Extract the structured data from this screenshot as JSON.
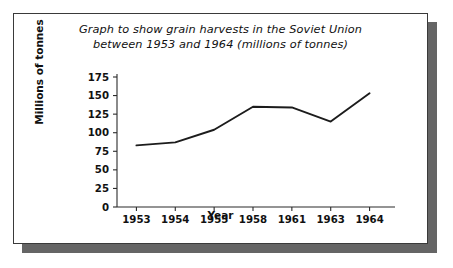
{
  "figure": {
    "title_line_1": "Graph to show grain harvests in the Soviet Union",
    "title_line_2": "between 1953 and 1964 (millions of tonnes)",
    "frame_border_color": "#3a3a3a",
    "shadow_color": "#4a4a4a",
    "line_color": "#1c1c1c",
    "background_color": "#ffffff"
  },
  "chart_data": {
    "type": "line",
    "title": "Graph to show grain harvests in the Soviet Union between 1953 and 1964 (millions of tonnes)",
    "xlabel": "Year",
    "ylabel": "Millions of tonnes",
    "categories": [
      "1953",
      "1954",
      "1955",
      "1958",
      "1961",
      "1963",
      "1964"
    ],
    "values": [
      83,
      87,
      104,
      135,
      134,
      115,
      153
    ],
    "series": [
      {
        "name": "Grain harvest",
        "values": [
          83,
          87,
          104,
          135,
          134,
          115,
          153
        ]
      }
    ],
    "ylim": [
      0,
      175
    ],
    "ytick_labels": [
      "0",
      "25",
      "50",
      "75",
      "100",
      "125",
      "150",
      "175"
    ],
    "ytick_values": [
      0,
      25,
      50,
      75,
      100,
      125,
      150,
      175
    ],
    "xtick_labels": [
      "1953",
      "1954",
      "1955",
      "1958",
      "1961",
      "1963",
      "1964"
    ],
    "grid": false,
    "legend": false,
    "units": "millions of tonnes"
  }
}
